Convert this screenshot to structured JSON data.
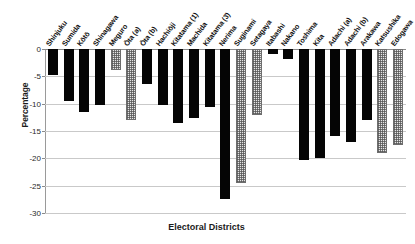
{
  "chart_data": {
    "type": "bar",
    "title": "",
    "xlabel": "Electoral Districts",
    "ylabel": "Percentage",
    "ylim": [
      -30,
      0
    ],
    "yticks": [
      0,
      -5,
      -10,
      -15,
      -20,
      -25,
      -30
    ],
    "ytick_labels": [
      "0",
      "-5",
      "-10",
      "-15",
      "-20",
      "-25",
      "-30"
    ],
    "grid": true,
    "legend": "none",
    "orientation": "vertical",
    "categories": [
      "Shinjuku",
      "Sumida",
      "Kōtō",
      "Shinagawa",
      "Meguro",
      "Ōta (a)",
      "Ōta (b)",
      "Hachiōji",
      "Kitatama (1)",
      "Machida",
      "Kitatama (3)",
      "Nerima",
      "Suginami",
      "Setagaya",
      "Itabashi",
      "Nakano",
      "Toshima",
      "Kita",
      "Adachi (a)",
      "Adachi (b)",
      "Arakawa",
      "Katsushika",
      "Edogawa"
    ],
    "values": [
      -4.8,
      -9.6,
      -11.5,
      -10.2,
      -3.9,
      -13.0,
      -6.4,
      -10.3,
      -13.5,
      -12.6,
      -10.6,
      -27.5,
      -24.5,
      -12.0,
      -1.0,
      -1.9,
      -20.3,
      -19.9,
      -16.0,
      -17.1,
      -12.9,
      -19.0,
      -17.5
    ],
    "bar_styles": [
      "solid",
      "solid",
      "solid",
      "solid",
      "hatched",
      "hatched",
      "solid",
      "solid",
      "solid",
      "solid",
      "solid",
      "solid",
      "hatched",
      "hatched",
      "solid",
      "solid",
      "solid",
      "solid",
      "solid",
      "solid",
      "solid",
      "hatched",
      "hatched"
    ],
    "colors": {
      "solid_bar": "#050505",
      "hatched_bar_fill": "#e6e6e6",
      "hatched_bar_edge": "#6d6d6d",
      "gridline": "#c9c9c9",
      "axis": "#8a8a8a",
      "text": "#121212",
      "background": "#ffffff"
    }
  }
}
